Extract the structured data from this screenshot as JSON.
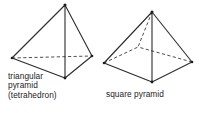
{
  "figure": {
    "type": "geometry-diagram",
    "background_color": "#ffffff",
    "line_color": "#2b2b2b",
    "text_color": "#242424",
    "shapes": [
      {
        "id": "triangular-pyramid",
        "name": "triangular pyramid",
        "caption_lines": [
          "triangular",
          "pyramid",
          "(tetrahedron)"
        ],
        "face_count": 4,
        "base_shape": "triangle",
        "vertices": {
          "apex": [
            65,
            5
          ],
          "front": [
            65,
            78
          ],
          "left": [
            12,
            58
          ],
          "right": [
            92,
            56
          ]
        },
        "solid_edges": [
          [
            "apex",
            "left"
          ],
          [
            "apex",
            "right"
          ],
          [
            "apex",
            "front"
          ],
          [
            "left",
            "front"
          ],
          [
            "right",
            "front"
          ]
        ],
        "hidden_edges": [
          [
            "left",
            "right"
          ]
        ]
      },
      {
        "id": "square-pyramid",
        "name": "square pyramid",
        "caption_lines": [
          "square pyramid"
        ],
        "face_count": 5,
        "base_shape": "square",
        "vertices": {
          "apex": [
            152,
            12
          ],
          "front": [
            152,
            82
          ],
          "left": [
            104,
            63
          ],
          "right": [
            192,
            62
          ],
          "back": [
            138,
            47
          ]
        },
        "solid_edges": [
          [
            "apex",
            "left"
          ],
          [
            "apex",
            "right"
          ],
          [
            "apex",
            "front"
          ],
          [
            "left",
            "front"
          ],
          [
            "right",
            "front"
          ]
        ],
        "hidden_edges": [
          [
            "apex",
            "back"
          ],
          [
            "left",
            "back"
          ],
          [
            "right",
            "back"
          ]
        ]
      }
    ]
  },
  "captions": {
    "triangular": {
      "line1": "triangular",
      "line2": "pyramid",
      "line3": "(tetrahedron)"
    },
    "square": {
      "line1": "square pyramid"
    }
  }
}
